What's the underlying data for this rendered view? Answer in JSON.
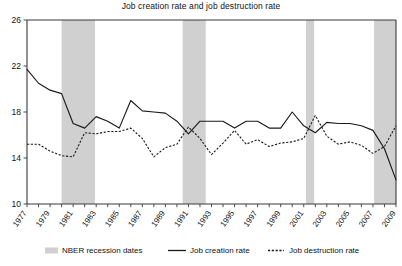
{
  "chart_data": {
    "type": "line",
    "title": "Job creation rate and job destruction rate",
    "xlabel": "",
    "ylabel": "",
    "ylim": [
      10,
      26
    ],
    "ytick_labels": [
      "10",
      "14",
      "18",
      "22",
      "26"
    ],
    "ytick_values": [
      10,
      14,
      18,
      22,
      26
    ],
    "xlim": [
      1977,
      2009
    ],
    "grid": false,
    "legend_position": "bottom",
    "x": [
      1977,
      1978,
      1979,
      1980,
      1981,
      1982,
      1983,
      1984,
      1985,
      1986,
      1987,
      1988,
      1989,
      1990,
      1991,
      1992,
      1993,
      1994,
      1995,
      1996,
      1997,
      1998,
      1999,
      2000,
      2001,
      2002,
      2003,
      2004,
      2005,
      2006,
      2007,
      2008,
      2009
    ],
    "xtick_labels": [
      "1977",
      "1979",
      "1981",
      "1983",
      "1985",
      "1987",
      "1989",
      "1991",
      "1993",
      "1995",
      "1997",
      "1999",
      "2001",
      "2003",
      "2005",
      "2007",
      "2009"
    ],
    "xtick_values": [
      1977,
      1979,
      1981,
      1983,
      1985,
      1987,
      1989,
      1991,
      1993,
      1995,
      1997,
      1999,
      2001,
      2003,
      2005,
      2007,
      2009
    ],
    "series": [
      {
        "name": "Job creation rate",
        "style": "solid",
        "color": "#1a1a1a",
        "values": [
          21.7,
          20.5,
          19.9,
          19.6,
          17.0,
          16.6,
          17.6,
          17.2,
          16.6,
          19.0,
          18.1,
          18.0,
          17.9,
          17.2,
          16.1,
          17.2,
          17.2,
          17.2,
          16.6,
          17.2,
          17.2,
          16.6,
          16.6,
          18.0,
          16.8,
          16.2,
          17.1,
          17.0,
          17.0,
          16.8,
          16.4,
          14.8,
          12.1
        ]
      },
      {
        "name": "Job destruction rate",
        "style": "dotted",
        "color": "#1a1a1a",
        "values": [
          15.2,
          15.2,
          14.6,
          14.2,
          14.1,
          16.2,
          16.1,
          16.3,
          16.3,
          16.6,
          15.7,
          14.1,
          14.9,
          15.2,
          16.7,
          15.7,
          14.3,
          15.3,
          16.4,
          15.2,
          15.6,
          15.0,
          15.3,
          15.4,
          15.7,
          17.7,
          15.9,
          15.2,
          15.4,
          15.1,
          14.4,
          15.0,
          16.8
        ]
      }
    ],
    "recession_bands": [
      {
        "label": "NBER recession",
        "start": 1980.0,
        "end": 1982.9
      },
      {
        "label": "NBER recession",
        "start": 1990.5,
        "end": 1992.5
      },
      {
        "label": "NBER recession",
        "start": 2001.2,
        "end": 2001.9
      },
      {
        "label": "NBER recession",
        "start": 2007.1,
        "end": 2009.9
      }
    ]
  },
  "legend": {
    "recession_label": "NBER recession dates",
    "creation_label": "Job creation rate",
    "destruction_label": "Job destruction rate",
    "recession_swatch_color": "#d0d0d0"
  },
  "colors": {
    "recession_band": "#d0d0d0",
    "line": "#1a1a1a",
    "axis": "#3a3a3a",
    "background": "#ffffff"
  }
}
